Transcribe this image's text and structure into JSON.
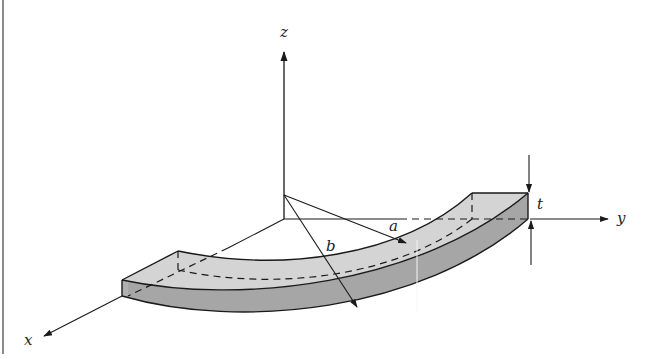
{
  "diagram": {
    "type": "3d-curved-bar-geometry",
    "axes": {
      "x": {
        "label": "x"
      },
      "y": {
        "label": "y"
      },
      "z": {
        "label": "z"
      }
    },
    "dimensions": {
      "inner_radius": {
        "label": "a"
      },
      "outer_radius": {
        "label": "b"
      },
      "thickness": {
        "label": "t"
      }
    },
    "colors": {
      "top_face": "#d4d4d4",
      "side_face": "#a6a6a6",
      "lines": "#1a1a1a",
      "frame_border": "#8a8a8a"
    }
  }
}
